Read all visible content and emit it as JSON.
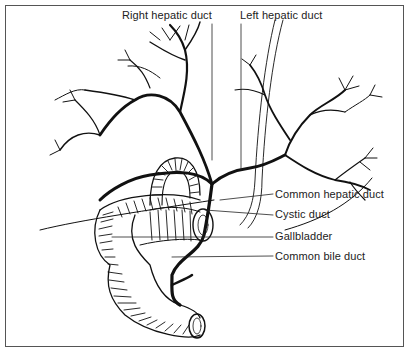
{
  "diagram": {
    "labels": {
      "right_hepatic_duct": "Right hepatic duct",
      "left_hepatic_duct": "Left hepatic duct",
      "common_hepatic_duct": "Common hepatic duct",
      "cystic_duct": "Cystic duct",
      "gallbladder": "Gallbladder",
      "common_bile_duct": "Common bile duct"
    },
    "colors": {
      "ink": "#111111",
      "frame": "#555555",
      "background": "#ffffff"
    }
  }
}
